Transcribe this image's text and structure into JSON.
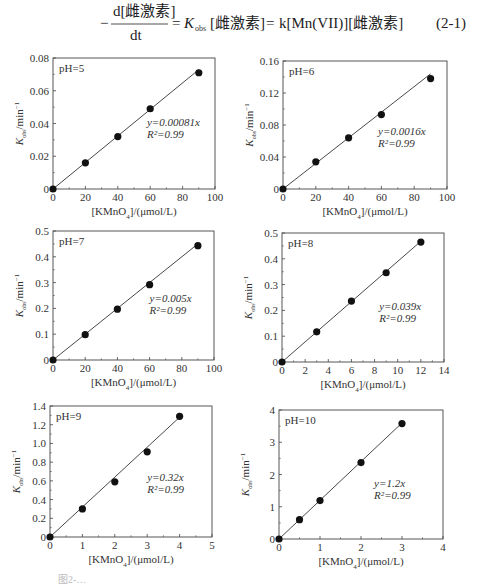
{
  "equation": {
    "lhs_numerator": "d[雌激素]",
    "lhs_denominator": "dt",
    "minus_sign": "−",
    "eq1": "=",
    "k_obs_symbol": "K",
    "k_obs_sub": "obs",
    "middle_bracket": "[雌激素]",
    "eq2": "=",
    "rhs": "k[Mn(VII)][雌激素]",
    "number": "(2-1)"
  },
  "figure_caption": "图2-…",
  "chart_data": [
    {
      "type": "scatter",
      "title": "pH=5",
      "xlabel": "[KMnO4]/(μmol/L)",
      "ylabel": "Kobs/min⁻¹",
      "xlim": [
        0,
        100
      ],
      "ylim": [
        0,
        0.08
      ],
      "xticks": [
        0,
        20,
        40,
        60,
        80,
        100
      ],
      "yticks": [
        0,
        0.02,
        0.04,
        0.06,
        0.08
      ],
      "xtick_labels": [
        "0",
        "20",
        "40",
        "60",
        "80",
        "100"
      ],
      "ytick_labels": [
        "0",
        "0.02",
        "0.04",
        "0.06",
        "0.08"
      ],
      "x": [
        0,
        20,
        40,
        60,
        90
      ],
      "y": [
        0,
        0.016,
        0.032,
        0.049,
        0.071
      ],
      "fit": {
        "slope": 0.00081,
        "equation": "y=0.00081x",
        "r2": "R²=0.99"
      },
      "grid": false
    },
    {
      "type": "scatter",
      "title": "pH=6",
      "xlabel": "[KMnO4]/(μmol/L)",
      "ylabel": "Kobs/min⁻¹",
      "xlim": [
        0,
        100
      ],
      "ylim": [
        0,
        0.16
      ],
      "xticks": [
        0,
        20,
        40,
        60,
        80,
        100
      ],
      "yticks": [
        0,
        0.04,
        0.08,
        0.12,
        0.16
      ],
      "xtick_labels": [
        "0",
        "20",
        "40",
        "60",
        "80",
        "100"
      ],
      "ytick_labels": [
        "0",
        "0.04",
        "0.08",
        "0.12",
        "0.16"
      ],
      "x": [
        0,
        20,
        40,
        60,
        90
      ],
      "y": [
        0,
        0.034,
        0.064,
        0.093,
        0.138
      ],
      "fit": {
        "slope": 0.0016,
        "equation": "y=0.0016x",
        "r2": "R²=0.99"
      },
      "grid": false
    },
    {
      "type": "scatter",
      "title": "pH=7",
      "xlabel": "[KMnO4]/(μmol/L)",
      "ylabel": "Kobs/min⁻¹",
      "xlim": [
        0,
        100
      ],
      "ylim": [
        0,
        0.5
      ],
      "xticks": [
        0,
        20,
        40,
        60,
        80,
        100
      ],
      "yticks": [
        0,
        0.1,
        0.2,
        0.3,
        0.4,
        0.5
      ],
      "xtick_labels": [
        "0",
        "20",
        "40",
        "60",
        "80",
        "100"
      ],
      "ytick_labels": [
        "0",
        "0.1",
        "0.2",
        "0.3",
        "0.4",
        "0.5"
      ],
      "x": [
        0,
        20,
        40,
        60,
        90
      ],
      "y": [
        0,
        0.098,
        0.197,
        0.292,
        0.443
      ],
      "fit": {
        "slope": 0.005,
        "equation": "y=0.005x",
        "r2": "R²=0.99"
      },
      "grid": false
    },
    {
      "type": "scatter",
      "title": "pH=8",
      "xlabel": "[KMnO4]/(μmol/L)",
      "ylabel": "Kobs/min⁻¹",
      "xlim": [
        0,
        14
      ],
      "ylim": [
        0,
        0.5
      ],
      "xticks": [
        0,
        2,
        4,
        6,
        8,
        10,
        12,
        14
      ],
      "yticks": [
        0,
        0.1,
        0.2,
        0.3,
        0.4,
        0.5
      ],
      "xtick_labels": [
        "0",
        "2",
        "4",
        "6",
        "8",
        "10",
        "12",
        "14"
      ],
      "ytick_labels": [
        "0",
        "0.1",
        "0.2",
        "0.3",
        "0.4",
        "0.5"
      ],
      "x": [
        0,
        3,
        6,
        9,
        12
      ],
      "y": [
        0,
        0.117,
        0.236,
        0.346,
        0.465
      ],
      "fit": {
        "slope": 0.039,
        "equation": "y=0.039x",
        "r2": "R²=0.99"
      },
      "grid": false
    },
    {
      "type": "scatter",
      "title": "pH=9",
      "xlabel": "[KMnO4]/(μmol/L)",
      "ylabel": "Kobs/min⁻¹",
      "xlim": [
        0,
        5
      ],
      "ylim": [
        0,
        1.4
      ],
      "xticks": [
        0,
        1,
        2,
        3,
        4,
        5
      ],
      "yticks": [
        0,
        0.2,
        0.4,
        0.6,
        0.8,
        1.0,
        1.2,
        1.4
      ],
      "xtick_labels": [
        "0",
        "1",
        "2",
        "3",
        "4",
        "5"
      ],
      "ytick_labels": [
        "0",
        "0.2",
        "0.4",
        "0.6",
        "0.8",
        "1.0",
        "1.2",
        "1.4"
      ],
      "x": [
        0,
        1,
        2,
        3,
        4
      ],
      "y": [
        0,
        0.3,
        0.59,
        0.91,
        1.29
      ],
      "fit": {
        "slope": 0.32,
        "equation": "y=0.32x",
        "r2": "R²=0.99"
      },
      "grid": false
    },
    {
      "type": "scatter",
      "title": "pH=10",
      "xlabel": "[KMnO4]/(μmol/L)",
      "ylabel": "Kobs/min⁻¹",
      "xlim": [
        0,
        4
      ],
      "ylim": [
        0,
        4
      ],
      "xticks": [
        0,
        1,
        2,
        3,
        4
      ],
      "yticks": [
        0,
        1,
        2,
        3,
        4
      ],
      "xtick_labels": [
        "0",
        "1",
        "2",
        "3",
        "4"
      ],
      "ytick_labels": [
        "0",
        "1",
        "2",
        "3",
        "4"
      ],
      "x": [
        0,
        0.5,
        1,
        2,
        3
      ],
      "y": [
        0,
        0.6,
        1.19,
        2.37,
        3.58
      ],
      "fit": {
        "slope": 1.2,
        "equation": "y=1.2x",
        "r2": "R²=0.99"
      },
      "grid": false
    }
  ]
}
